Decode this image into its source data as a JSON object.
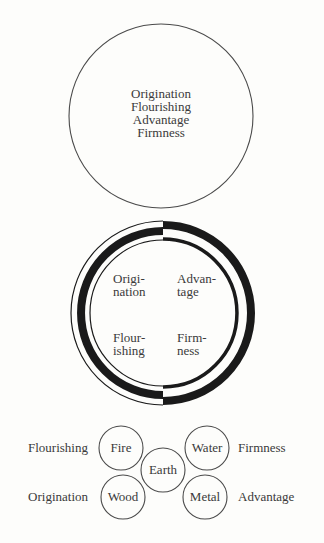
{
  "diagram": {
    "unity_circle": {
      "lines": [
        "Origination",
        "Flourishing",
        "Advantage",
        "Firmness"
      ]
    },
    "yin_yang_ring": {
      "quadrants": {
        "top_left": [
          "Origi-",
          "nation"
        ],
        "top_right": [
          "Advan-",
          "tage"
        ],
        "bottom_left": [
          "Flour-",
          "ishing"
        ],
        "bottom_right": [
          "Firm-",
          "ness"
        ]
      }
    },
    "five_phases": {
      "elements": {
        "fire": "Fire",
        "water": "Water",
        "earth": "Earth",
        "wood": "Wood",
        "metal": "Metal"
      },
      "side_labels": {
        "fire": "Flourishing",
        "water": "Firmness",
        "wood": "Origination",
        "metal": "Advantage"
      }
    }
  }
}
